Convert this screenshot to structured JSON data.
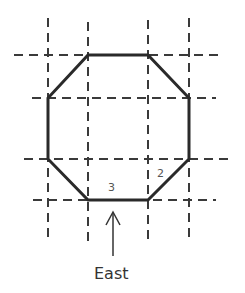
{
  "diagram": {
    "type": "octagon-on-grid",
    "colors": {
      "grid": "#3a3a3a",
      "octagon": "#2a2a2a",
      "text": "#333333",
      "background": "#ffffff"
    },
    "grid": {
      "vertical_x": [
        48,
        88,
        148,
        189
      ],
      "horizontal_y": [
        55,
        98,
        159,
        200
      ]
    },
    "octagon_vertices": [
      [
        88,
        55
      ],
      [
        148,
        55
      ],
      [
        189,
        98
      ],
      [
        189,
        159
      ],
      [
        148,
        200
      ],
      [
        88,
        200
      ],
      [
        48,
        159
      ],
      [
        48,
        98
      ]
    ],
    "edge_labels": [
      {
        "text": "3",
        "edge": "bottom"
      },
      {
        "text": "2",
        "edge": "bottom-right-diagonal"
      }
    ],
    "direction_arrow": {
      "label": "East",
      "points_to": "bottom edge"
    }
  }
}
